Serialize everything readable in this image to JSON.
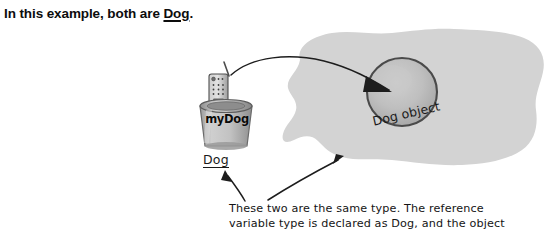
{
  "header": {
    "text_before": "In this example, both are ",
    "emphasis": "Dog",
    "text_after": "."
  },
  "diagram": {
    "variable_cup": {
      "name": "myDog",
      "type_label": "Dog",
      "icon": "remote-control-in-cup"
    },
    "heap": {
      "shape": "blob",
      "fill_color": "#d3d3d3",
      "object": {
        "label": "Dog object",
        "shape": "sphere",
        "fill_color": "#bcbcbc"
      }
    },
    "reference_arrow": {
      "from": "myDog",
      "to": "Dog object",
      "style": "curved-line-with-arrowhead"
    },
    "callout_arrows": [
      {
        "name": "arrow-to-dog-type",
        "direction": "up-left"
      },
      {
        "name": "arrow-to-dog-object",
        "direction": "up-right"
      }
    ]
  },
  "caption": {
    "line1": "These two are the same type. The reference",
    "line2": "variable type is declared as Dog, and the object"
  },
  "colors": {
    "ink": "#1a1a1a",
    "heap_gray": "#d3d3d3",
    "sphere_gray": "#bcbcbc",
    "cup_gray": "#b9b9b9"
  }
}
